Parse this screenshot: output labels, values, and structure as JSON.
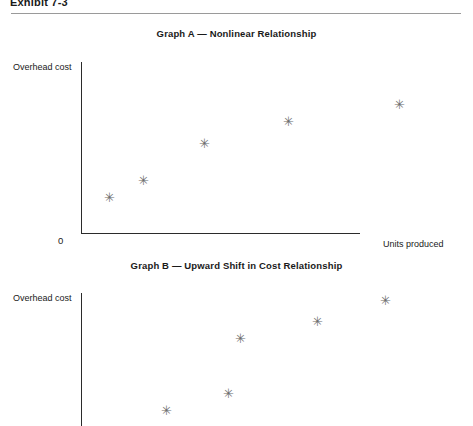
{
  "page": {
    "exhibit_label": "Exhibit 7-3",
    "background_color": "#ffffff",
    "rule_color": "#9a9a9a"
  },
  "chart_data": [
    {
      "id": "graph-a",
      "type": "scatter",
      "title": "Graph A — Nonlinear Relationship",
      "xlabel": "Units produced",
      "ylabel": "Overhead cost",
      "origin_label": "0",
      "grid": false,
      "legend": "none",
      "marker": "asterisk",
      "marker_color": "#6d6d6d",
      "axis_color": "#2b2b2b",
      "xlim": [
        0,
        100
      ],
      "ylim": [
        0,
        100
      ],
      "points": [
        {
          "x": 8,
          "y": 25
        },
        {
          "x": 17,
          "y": 35
        },
        {
          "x": 33,
          "y": 57
        },
        {
          "x": 55,
          "y": 70
        },
        {
          "x": 84,
          "y": 80
        }
      ],
      "points_px": [
        {
          "x": 109,
          "y": 197
        },
        {
          "x": 143,
          "y": 180
        },
        {
          "x": 204,
          "y": 143
        },
        {
          "x": 288,
          "y": 121
        },
        {
          "x": 399,
          "y": 104
        }
      ]
    },
    {
      "id": "graph-b",
      "type": "scatter",
      "title": "Graph B — Upward Shift in Cost Relationship",
      "xlabel": "",
      "ylabel": "Overhead cost",
      "origin_label": "",
      "grid": false,
      "legend": "none",
      "marker": "asterisk",
      "marker_color": "#6d6d6d",
      "axis_color": "#2b2b2b",
      "xlim": [
        0,
        100
      ],
      "ylim": [
        0,
        100
      ],
      "points": [
        {
          "x": 23,
          "y": 12
        },
        {
          "x": 39,
          "y": 26
        },
        {
          "x": 42,
          "y": 52
        },
        {
          "x": 62,
          "y": 64
        },
        {
          "x": 79,
          "y": 82
        }
      ],
      "points_px": [
        {
          "x": 166,
          "y": 410
        },
        {
          "x": 228,
          "y": 393
        },
        {
          "x": 240,
          "y": 338
        },
        {
          "x": 317,
          "y": 321
        },
        {
          "x": 385,
          "y": 300
        }
      ]
    }
  ],
  "marker_glyph": "✳"
}
